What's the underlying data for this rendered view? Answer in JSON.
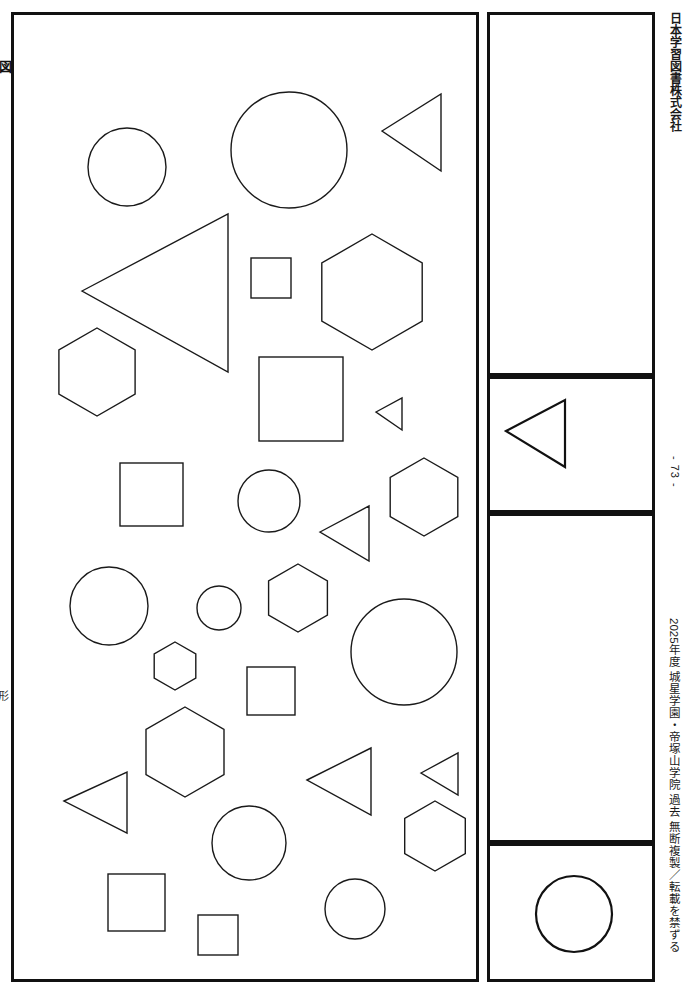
{
  "document": {
    "page_number_label": "- 73 -",
    "publisher": "日本学習図書株式会社",
    "copyright_notice": "2025年度 城星学園・帝塚山学院 過去 無断複製／転載を禁ずる",
    "edge_text_top": "図",
    "edge_text_bottom": "形"
  },
  "panels": {
    "main": {
      "name": "shape-field",
      "label": ""
    },
    "blank": {
      "name": "answer-box-blank",
      "label": ""
    },
    "triangle": {
      "name": "example-triangle-box",
      "label": ""
    },
    "middle": {
      "name": "answer-box-middle",
      "label": ""
    },
    "circle": {
      "name": "example-circle-box",
      "label": ""
    }
  },
  "shape_counts": {
    "circle": 9,
    "square": 9,
    "triangle": 8,
    "hexagon": 9
  },
  "main_shapes": [
    {
      "id": 1,
      "type": "circle",
      "cx": 113,
      "cy": 152,
      "r": 39
    },
    {
      "id": 2,
      "type": "circle",
      "cx": 275,
      "cy": 135,
      "r": 58
    },
    {
      "id": 3,
      "type": "triangle",
      "points": "368,116 427,79 427,156"
    },
    {
      "id": 4,
      "type": "triangle",
      "points": "68,276 214,199 214,357"
    },
    {
      "id": 5,
      "type": "square",
      "x": 237,
      "y": 243,
      "w": 40,
      "h": 40
    },
    {
      "id": 6,
      "type": "hexagon",
      "cx": 358,
      "cy": 277,
      "r": 58
    },
    {
      "id": 7,
      "type": "hexagon",
      "cx": 83,
      "cy": 357,
      "r": 44
    },
    {
      "id": 8,
      "type": "square",
      "x": 245,
      "y": 342,
      "w": 84,
      "h": 84
    },
    {
      "id": 9,
      "type": "triangle",
      "points": "362,397 388,383 388,415"
    },
    {
      "id": 10,
      "type": "square",
      "x": 106,
      "y": 448,
      "w": 63,
      "h": 63
    },
    {
      "id": 11,
      "type": "circle",
      "cx": 255,
      "cy": 486,
      "r": 31
    },
    {
      "id": 12,
      "type": "triangle",
      "points": "306,517 355,491 355,546"
    },
    {
      "id": 13,
      "type": "hexagon",
      "cx": 410,
      "cy": 482,
      "r": 39
    },
    {
      "id": 14,
      "type": "circle",
      "cx": 95,
      "cy": 591,
      "r": 39
    },
    {
      "id": 15,
      "type": "circle",
      "cx": 205,
      "cy": 593,
      "r": 22
    },
    {
      "id": 16,
      "type": "hexagon",
      "cx": 284,
      "cy": 583,
      "r": 34
    },
    {
      "id": 17,
      "type": "circle",
      "cx": 390,
      "cy": 637,
      "r": 53
    },
    {
      "id": 18,
      "type": "hexagon",
      "cx": 161,
      "cy": 651,
      "r": 24
    },
    {
      "id": 19,
      "type": "square",
      "x": 233,
      "y": 652,
      "w": 48,
      "h": 48
    },
    {
      "id": 20,
      "type": "hexagon",
      "cx": 171,
      "cy": 737,
      "r": 45
    },
    {
      "id": 21,
      "type": "triangle",
      "points": "293,765 357,733 357,800"
    },
    {
      "id": 22,
      "type": "triangle",
      "points": "407,758 444,738 444,780"
    },
    {
      "id": 23,
      "type": "triangle",
      "points": "50,786 113,757 113,818"
    },
    {
      "id": 24,
      "type": "circle",
      "cx": 235,
      "cy": 828,
      "r": 37
    },
    {
      "id": 25,
      "type": "hexagon",
      "cx": 421,
      "cy": 821,
      "r": 35
    },
    {
      "id": 26,
      "type": "square",
      "x": 94,
      "y": 859,
      "w": 57,
      "h": 57
    },
    {
      "id": 27,
      "type": "circle",
      "cx": 341,
      "cy": 894,
      "r": 30
    },
    {
      "id": 28,
      "type": "square",
      "x": 184,
      "y": 900,
      "w": 40,
      "h": 40
    }
  ],
  "example_triangle": {
    "type": "triangle",
    "points": "16,52 75,21 75,88"
  },
  "example_circle": {
    "type": "circle",
    "cx": 84,
    "cy": 68,
    "r": 38
  },
  "colors": {
    "stroke": "#1a1a1a",
    "frame": "#111111",
    "background": "#ffffff"
  }
}
